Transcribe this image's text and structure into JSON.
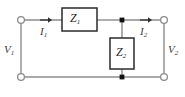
{
  "figure": {
    "name": "two-port-l-network-circuit",
    "colors": {
      "wire": "#8c8c8c",
      "component_border": "#2b2b2b",
      "component_fill": "#ffffff",
      "node_dot": "#111111",
      "terminal_stroke": "#8c8c8c",
      "terminal_fill": "#ffffff",
      "text": "#3a3a3a",
      "background": "#ffffff"
    }
  },
  "labels": {
    "v1": "V",
    "v1_sub": "1",
    "v2": "V",
    "v2_sub": "2",
    "i1": "I",
    "i1_sub": "1",
    "i2": "I",
    "i2_sub": "2",
    "z1": "Z",
    "z1_sub": "1",
    "z2": "Z",
    "z2_sub": "2"
  },
  "components": [
    {
      "id": "Z1",
      "type": "impedance-box",
      "orientation": "horizontal",
      "label": "Z1",
      "position": "series-top-branch"
    },
    {
      "id": "Z2",
      "type": "impedance-box",
      "orientation": "vertical",
      "label": "Z2",
      "position": "shunt-middle-branch"
    }
  ],
  "terminals": [
    {
      "id": "top-left",
      "label": "port-1-positive",
      "style": "open-circle"
    },
    {
      "id": "bottom-left",
      "label": "port-1-negative",
      "style": "open-circle"
    },
    {
      "id": "top-right",
      "label": "port-2-positive",
      "style": "open-circle"
    },
    {
      "id": "bottom-right",
      "label": "port-2-negative",
      "style": "open-circle"
    }
  ],
  "junctions": [
    {
      "id": "top-node",
      "style": "filled-dot"
    },
    {
      "id": "bottom-node",
      "style": "filled-dot"
    }
  ],
  "currents": [
    {
      "id": "I1",
      "label": "I1",
      "direction": "rightward",
      "branch": "top-left-series"
    },
    {
      "id": "I2",
      "label": "I2",
      "direction": "rightward",
      "branch": "top-right-series"
    }
  ]
}
